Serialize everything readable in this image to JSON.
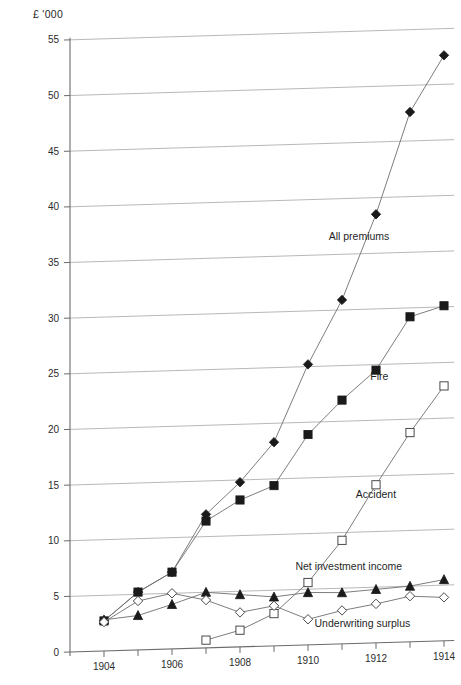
{
  "chart_data": {
    "type": "line",
    "title": "",
    "subtitle": "",
    "xlabel": "",
    "ylabel": "£ '000",
    "ylim": [
      0,
      55
    ],
    "xlim": [
      1903,
      1914
    ],
    "grid": "horizontal",
    "legend": "inline-annotations",
    "x": [
      1904,
      1905,
      1906,
      1907,
      1908,
      1909,
      1910,
      1911,
      1912,
      1913,
      1914
    ],
    "y_ticks": [
      0,
      5,
      10,
      15,
      20,
      25,
      30,
      35,
      40,
      45,
      50,
      55
    ],
    "x_ticks": [
      1904,
      1905,
      1906,
      1907,
      1908,
      1909,
      1910,
      1911,
      1912,
      1913,
      1914
    ],
    "x_tick_labels": [
      "1904",
      "",
      "1906",
      "",
      "1908",
      "",
      "1910",
      "",
      "1912",
      "",
      "1914"
    ],
    "series": [
      {
        "name": "All premiums",
        "marker": "filled-diamond",
        "label_x": 1911.5,
        "label_y": 36.2,
        "values": [
          2.7,
          5.2,
          6.9,
          12.0,
          14.8,
          18.3,
          25.2,
          30.9,
          38.5,
          47.6,
          52.6
        ]
      },
      {
        "name": "Fire",
        "marker": "filled-square",
        "label_x": 1912.1,
        "label_y": 23.6,
        "values": [
          2.7,
          5.2,
          6.9,
          11.4,
          13.2,
          14.4,
          18.9,
          21.9,
          24.5,
          29.2,
          30.1
        ]
      },
      {
        "name": "Accident",
        "marker": "open-square",
        "label_x": 1912.0,
        "label_y": 13.0,
        "values": [
          null,
          null,
          null,
          0.7,
          1.5,
          2.9,
          5.6,
          9.3,
          14.2,
          18.8,
          22.9
        ]
      },
      {
        "name": "Net investment income",
        "marker": "filled-triangle",
        "label_x": 1911.2,
        "label_y": 6.6,
        "values": [
          2.8,
          3.1,
          4.0,
          5.0,
          4.7,
          4.4,
          4.7,
          4.6,
          4.8,
          5.0,
          5.5
        ]
      },
      {
        "name": "Underwriting surplus",
        "marker": "open-diamond",
        "label_x": 1911.6,
        "label_y": 1.5,
        "values": [
          2.6,
          4.4,
          5.0,
          4.3,
          3.1,
          3.6,
          2.3,
          3.0,
          3.5,
          4.1,
          3.9
        ]
      }
    ]
  },
  "axes": {
    "y_axis_caption": "£ '000"
  }
}
